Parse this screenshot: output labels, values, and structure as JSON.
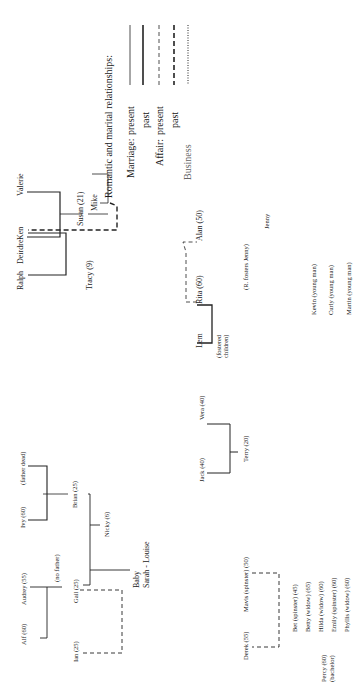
{
  "orientation": "rotated 90deg counter-clockwise",
  "legend": {
    "title": "Romantic and marital relationships:",
    "entries": [
      {
        "group": "Marriage:",
        "label": "present",
        "style": "solid-thin"
      },
      {
        "group": "",
        "label": "past",
        "style": "solid-thick"
      },
      {
        "group": "Affair:",
        "label": "present",
        "style": "dashed-thin"
      },
      {
        "group": "",
        "label": "past",
        "style": "dashed-thick"
      },
      {
        "group": "",
        "label": "Business",
        "style": "dotted"
      }
    ]
  },
  "families": {
    "ken_valerie": {
      "people": [
        "Ken",
        "Valerie",
        "Susan (21)",
        "Mike"
      ]
    },
    "ralph_deirdre": {
      "people": [
        "Ralph",
        "Deirdre",
        "Tracy (9)"
      ]
    },
    "lem_rita_alan": {
      "people": [
        "Lem",
        "Rita (60)",
        "Alan (50)",
        "(fostered children)",
        "(R. fosters Jenny)",
        "Jenny"
      ]
    },
    "young_men": [
      "Kevin (young man)",
      "Curly (young man)",
      "Martin (young man)"
    ],
    "jack_vera": {
      "people": [
        "Jack (40)",
        "Vera (40)",
        "Terry (20)"
      ]
    },
    "alf_audrey": {
      "people": [
        "Alf (60)",
        "Audrey (55)",
        "(no father)",
        "Gail (25)",
        "Ian (25)"
      ]
    },
    "ivy": {
      "people": [
        "Ivy (60)",
        "(father dead)",
        "Brian (25)",
        "Nicky (6)",
        "Baby",
        "Sarah - Louise"
      ]
    },
    "derek_mavis": {
      "people": [
        "Derek (55)",
        "Mavis (spinster) (50)",
        "Percy (60)",
        "(bachelor)"
      ]
    },
    "single_women": [
      "Bet (spinster) (45)",
      "Betty (widow) (65)",
      "Hilda (widow) (60)",
      "Emily (spinster) (60)",
      "Phyllis (widow) (60)"
    ]
  }
}
